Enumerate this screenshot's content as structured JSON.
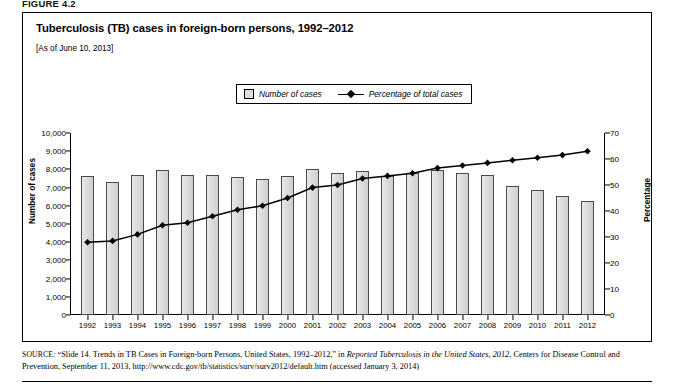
{
  "figure": {
    "label": "FIGURE 4.2"
  },
  "title": "Tuberculosis (TB) cases in foreign-born persons, 1992–2012",
  "subtitle": "[As of June 10, 2013]",
  "legend": {
    "bars_label": "Number of cases",
    "line_label": "Percentage of total cases"
  },
  "axes": {
    "left_title": "Number of cases",
    "right_title": "Percentage",
    "left_ticks": [
      "10,000",
      "9,000",
      "8,000",
      "7,000",
      "6,000",
      "5,000",
      "4,000",
      "3,000",
      "2,000",
      "1,000",
      "0"
    ],
    "right_ticks": [
      "70",
      "60",
      "50",
      "40",
      "30",
      "20",
      "10",
      "0"
    ]
  },
  "source": {
    "prefix": "SOURCE:",
    "text_1": " “Slide 14. Trends in TB Cases in Foreign-born Persons, United States, 1992–2012,” in ",
    "italic_1": "Reported Tuberculosis in the United States, 2012",
    "text_2": ", Centers for Disease Control and Prevention, September 11, 2013, http://www.cdc.gov/tb/statistics/surv/surv2012/default.htm (accessed January 3, 2014)"
  },
  "chart_data": {
    "type": "bar",
    "title": "Tuberculosis (TB) cases in foreign-born persons, 1992–2012",
    "subtitle": "[As of June 10, 2013]",
    "xlabel": "",
    "ylabel": "Number of cases",
    "y2label": "Percentage",
    "ylim": [
      0,
      10000
    ],
    "y2lim": [
      0,
      70
    ],
    "grid": false,
    "legend_position": "top-center",
    "categories": [
      "1992",
      "1993",
      "1994",
      "1995",
      "1996",
      "1997",
      "1998",
      "1999",
      "2000",
      "2001",
      "2002",
      "2003",
      "2004",
      "2005",
      "2006",
      "2007",
      "2008",
      "2009",
      "2010",
      "2011",
      "2012"
    ],
    "series": [
      {
        "name": "Number of cases",
        "type": "bar",
        "axis": "left",
        "values": [
          7640,
          7330,
          7690,
          7980,
          7680,
          7680,
          7580,
          7480,
          7620,
          8020,
          7830,
          7920,
          7660,
          7780,
          7950,
          7820,
          7670,
          7080,
          6860,
          6550,
          6270
        ]
      },
      {
        "name": "Percentage of total cases",
        "type": "line",
        "axis": "right",
        "values": [
          28.0,
          28.5,
          31.0,
          34.5,
          35.5,
          38.0,
          40.5,
          42.0,
          45.0,
          49.0,
          50.0,
          52.5,
          53.5,
          54.5,
          56.5,
          57.5,
          58.5,
          59.5,
          60.5,
          61.5,
          63.0
        ]
      }
    ]
  }
}
